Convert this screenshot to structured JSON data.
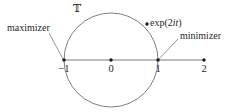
{
  "figure": {
    "background_color": "#ffffff",
    "width": 240,
    "height": 112,
    "stroke_color": "#6b6b6b",
    "axis_color": "#a6a6a6",
    "point_color": "#1a1a1a",
    "leader_color": "#8a8a8a"
  },
  "set_symbol": {
    "label": "𝕋",
    "meaning": "unit-circle-torus-symbol",
    "x": 77,
    "y": 4
  },
  "circle": {
    "center_x": 111,
    "center_y": 60,
    "radius": 47,
    "label": "unit circle"
  },
  "axis": {
    "y": 60,
    "x_start": 64,
    "x_end": 205,
    "ticks": [
      {
        "label": "−1",
        "value": -1,
        "x": 64
      },
      {
        "label": "0",
        "value": 0,
        "x": 111
      },
      {
        "label": "1",
        "value": 1,
        "x": 158
      },
      {
        "label": "2",
        "value": 2,
        "x": 204
      }
    ]
  },
  "points": [
    {
      "name": "point-minus-one",
      "x": 64,
      "y": 60
    },
    {
      "name": "point-zero",
      "x": 111,
      "y": 60
    },
    {
      "name": "point-one",
      "x": 158,
      "y": 60
    },
    {
      "name": "point-two",
      "x": 204,
      "y": 60
    },
    {
      "name": "point-exp-2it",
      "x": 147,
      "y": 24
    }
  ],
  "annotations": {
    "maximizer": {
      "label": "maximizer",
      "text_x": 7,
      "text_y": 23,
      "leader_from_x": 49,
      "leader_from_y": 33,
      "leader_to_x": 63,
      "leader_to_y": 59
    },
    "minimizer": {
      "label": "minimizer",
      "text_x": 180,
      "text_y": 31,
      "leader_from_x": 178,
      "leader_from_y": 39,
      "leader_to_x": 159,
      "leader_to_y": 59
    },
    "exp_point": {
      "label_prefix": "exp(2",
      "label_italic": "it",
      "label_suffix": ")",
      "text_x": 151,
      "text_y": 18
    }
  }
}
